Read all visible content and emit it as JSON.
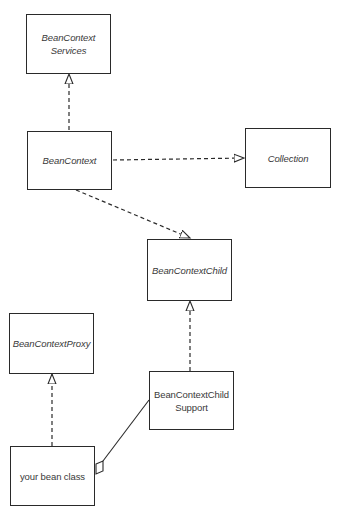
{
  "diagram": {
    "type": "UML class diagram",
    "classes": [
      {
        "id": "services",
        "label": "BeanContext\nServices",
        "italic": true
      },
      {
        "id": "beancontext",
        "label": "BeanContext",
        "italic": true
      },
      {
        "id": "collection",
        "label": "Collection",
        "italic": true
      },
      {
        "id": "child",
        "label": "BeanContextChild",
        "italic": true
      },
      {
        "id": "proxy",
        "label": "BeanContextProxy",
        "italic": true
      },
      {
        "id": "support",
        "label": "BeanContextChild\nSupport",
        "italic": false
      },
      {
        "id": "yourbean",
        "label": "your bean class",
        "italic": false
      }
    ],
    "relationships": [
      {
        "from": "beancontext",
        "to": "services",
        "kind": "realization (dashed, hollow arrow)"
      },
      {
        "from": "beancontext",
        "to": "collection",
        "kind": "realization (dashed, hollow arrow)"
      },
      {
        "from": "beancontext",
        "to": "child",
        "kind": "realization (dashed, hollow arrow)"
      },
      {
        "from": "support",
        "to": "child",
        "kind": "realization (dashed, hollow arrow)"
      },
      {
        "from": "yourbean",
        "to": "proxy",
        "kind": "realization (dashed, hollow arrow)"
      },
      {
        "from": "yourbean",
        "to": "support",
        "kind": "aggregation (solid line, hollow diamond)"
      }
    ],
    "colors": {
      "line": "#2a2a2a",
      "text": "#3a3a3a",
      "background": "#ffffff"
    }
  }
}
